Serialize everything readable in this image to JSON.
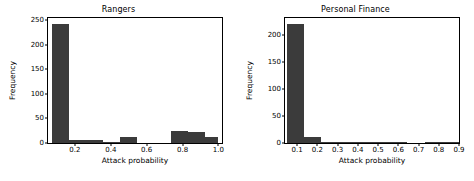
{
  "figure": {
    "background": "#ffffff",
    "bar_color": "#3b3b3b",
    "axis_color": "#000000"
  },
  "chart_data": [
    {
      "type": "bar",
      "title": "Rangers",
      "xlabel": "Attack probability",
      "ylabel": "Frequency",
      "grid": false,
      "legend": false,
      "xlim": [
        0.05,
        1.02
      ],
      "ylim": [
        0,
        255
      ],
      "xticks": [
        "0.2",
        "0.4",
        "0.6",
        "0.8",
        "1.0"
      ],
      "xtick_values": [
        0.2,
        0.4,
        0.6,
        0.8,
        1.0
      ],
      "yticks": [
        "0",
        "50",
        "100",
        "150",
        "200",
        "250"
      ],
      "ytick_values": [
        0,
        50,
        100,
        150,
        200,
        250
      ],
      "bin_edges": [
        0.07,
        0.165,
        0.26,
        0.355,
        0.45,
        0.545,
        0.64,
        0.735,
        0.83,
        0.925,
        1.0
      ],
      "values": [
        243,
        6,
        6,
        3,
        12,
        0,
        0,
        24,
        22,
        12
      ]
    },
    {
      "type": "bar",
      "title": "Personal Finance",
      "xlabel": "Attack probability",
      "ylabel": "Frequency",
      "grid": false,
      "legend": false,
      "xlim": [
        0.04,
        0.9
      ],
      "ylim": [
        0,
        232
      ],
      "xticks": [
        "0.1",
        "0.2",
        "0.3",
        "0.4",
        "0.5",
        "0.6",
        "0.7",
        "0.8",
        "0.9"
      ],
      "xtick_values": [
        0.1,
        0.2,
        0.3,
        0.4,
        0.5,
        0.6,
        0.7,
        0.8,
        0.9
      ],
      "yticks": [
        "0",
        "50",
        "100",
        "150",
        "200"
      ],
      "ytick_values": [
        0,
        50,
        100,
        150,
        200
      ],
      "bin_edges": [
        0.05,
        0.135,
        0.22,
        0.305,
        0.39,
        0.475,
        0.56,
        0.645,
        0.73,
        0.815,
        0.9
      ],
      "values": [
        220,
        12,
        2,
        1,
        1,
        1,
        1,
        0,
        1,
        1
      ]
    }
  ]
}
